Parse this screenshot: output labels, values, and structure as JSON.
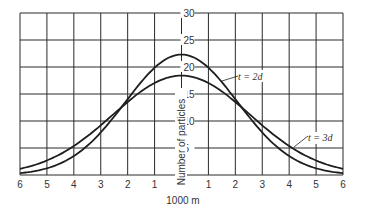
{
  "chart_data": {
    "type": "line",
    "title": "",
    "xlabel": "1000 m",
    "ylabel": "Number of particles",
    "xlim": [
      -6,
      6
    ],
    "ylim": [
      0,
      30
    ],
    "grid": true,
    "x_tick_labels": [
      "6",
      "5",
      "4",
      "3",
      "2",
      "1",
      "0",
      "1",
      "2",
      "3",
      "4",
      "5",
      "6"
    ],
    "y_tick_labels": [
      "5",
      "10",
      "15",
      "20",
      "25",
      "30"
    ],
    "x": [
      -6,
      -5,
      -4,
      -3,
      -2,
      -1,
      0,
      1,
      2,
      3,
      4,
      5,
      6
    ],
    "series": [
      {
        "name": "t = 2d",
        "values": [
          0.3,
          1.2,
          3.5,
          7.3,
          14.0,
          19.0,
          22.3,
          19.0,
          14.0,
          7.3,
          3.5,
          1.2,
          0.3
        ]
      },
      {
        "name": "t = 3d",
        "values": [
          1.2,
          2.7,
          5.4,
          9.2,
          13.9,
          17.0,
          18.4,
          17.0,
          13.9,
          9.2,
          5.4,
          2.7,
          1.2
        ]
      }
    ],
    "annotations": [
      "t = 2d",
      "t = 3d"
    ]
  }
}
